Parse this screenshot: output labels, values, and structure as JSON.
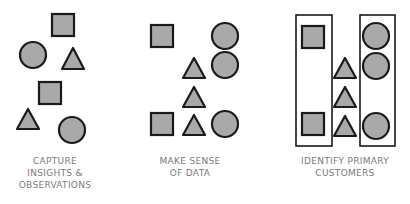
{
  "colors": {
    "shape_fill": "#a9a9a9",
    "shape_stroke": "#1a1a1a",
    "label_text": "#7a7a7a",
    "background": "#ffffff"
  },
  "panels": [
    {
      "id": "capture",
      "caption_lines": [
        "CAPTURE",
        "INSIGHTS &",
        "OBSERVATIONS"
      ],
      "shapes": [
        {
          "type": "square",
          "x": 52,
          "y": 14,
          "size": 22
        },
        {
          "type": "circle",
          "cx": 33,
          "cy": 55,
          "r": 13
        },
        {
          "type": "triangle",
          "x": 62,
          "y": 48,
          "w": 22,
          "h": 21
        },
        {
          "type": "square",
          "x": 39,
          "y": 82,
          "size": 22
        },
        {
          "type": "triangle",
          "x": 17,
          "y": 109,
          "w": 22,
          "h": 20
        },
        {
          "type": "circle",
          "cx": 72,
          "cy": 130,
          "r": 13
        }
      ]
    },
    {
      "id": "make-sense",
      "caption_lines": [
        "MAKE SENSE",
        "OF DATA"
      ],
      "shapes": [
        {
          "type": "square",
          "x": 151,
          "y": 25,
          "size": 22
        },
        {
          "type": "circle",
          "cx": 225,
          "cy": 36,
          "r": 13
        },
        {
          "type": "triangle",
          "x": 183,
          "y": 58,
          "w": 22,
          "h": 20
        },
        {
          "type": "circle",
          "cx": 225,
          "cy": 65,
          "r": 13
        },
        {
          "type": "triangle",
          "x": 183,
          "y": 87,
          "w": 22,
          "h": 20
        },
        {
          "type": "square",
          "x": 151,
          "y": 113,
          "size": 22
        },
        {
          "type": "triangle",
          "x": 183,
          "y": 115,
          "w": 22,
          "h": 20
        },
        {
          "type": "circle",
          "cx": 225,
          "cy": 124,
          "r": 13
        }
      ]
    },
    {
      "id": "identify",
      "caption_lines": [
        "IDENTIFY PRIMARY",
        "CUSTOMERS"
      ],
      "groups": [
        {
          "x": 296,
          "y": 15,
          "w": 36,
          "h": 131
        },
        {
          "x": 360,
          "y": 15,
          "w": 35,
          "h": 131
        }
      ],
      "shapes": [
        {
          "type": "square",
          "x": 302,
          "y": 26,
          "size": 22
        },
        {
          "type": "circle",
          "cx": 376,
          "cy": 36,
          "r": 13
        },
        {
          "type": "triangle",
          "x": 334,
          "y": 58,
          "w": 22,
          "h": 20
        },
        {
          "type": "circle",
          "cx": 376,
          "cy": 66,
          "r": 13
        },
        {
          "type": "triangle",
          "x": 334,
          "y": 87,
          "w": 22,
          "h": 20
        },
        {
          "type": "square",
          "x": 302,
          "y": 113,
          "size": 22
        },
        {
          "type": "triangle",
          "x": 334,
          "y": 116,
          "w": 22,
          "h": 20
        },
        {
          "type": "circle",
          "cx": 376,
          "cy": 126,
          "r": 13
        }
      ]
    }
  ]
}
